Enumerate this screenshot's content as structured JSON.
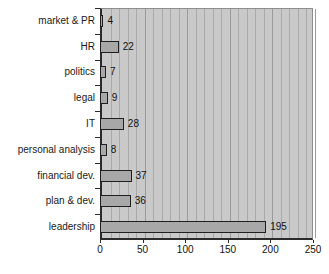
{
  "chart_data": {
    "type": "bar",
    "orientation": "horizontal",
    "title": "",
    "xlabel": "",
    "ylabel": "",
    "xlim": [
      0,
      250
    ],
    "xticks": [
      0,
      50,
      100,
      150,
      200,
      250
    ],
    "grid": true,
    "grid_step": 10,
    "legend": "none",
    "categories": [
      "market & PR",
      "HR",
      "politics",
      "legal",
      "IT",
      "personal analysis",
      "financial dev.",
      "plan & dev.",
      "leadership"
    ],
    "values": [
      4,
      22,
      7,
      9,
      28,
      8,
      37,
      36,
      195
    ],
    "value_labels": [
      "4",
      "22",
      "7",
      "9",
      "28",
      "8",
      "37",
      "36",
      "195"
    ],
    "colors": {
      "bar_fill": "#a8a8a8",
      "bar_edge": "#1f1f1f",
      "plot_background": "#c9c9c9",
      "gridline": "#a9a9a9",
      "axis": "#2b2b2b",
      "text": "#111111",
      "page_background": "#ffffff"
    }
  }
}
